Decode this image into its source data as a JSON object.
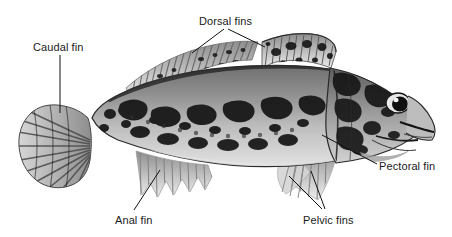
{
  "figure": {
    "type": "anatomical-diagram",
    "background_color": "#ffffff",
    "illustration_style": "grayscale-stipple-drawing",
    "label_text_color": "#1a1a1a",
    "leader_line_color": "#111111"
  },
  "labels": {
    "caudal_fin": "Caudal fin",
    "dorsal_fins": "Dorsal fins",
    "pectoral_fin": "Pectoral fin",
    "anal_fin": "Anal fin",
    "pelvic_fins": "Pelvic fins"
  },
  "callouts": [
    {
      "name": "caudal-fin",
      "label": "Caudal fin",
      "text_x": 33,
      "text_y": 41,
      "branches": 1
    },
    {
      "name": "dorsal-fins",
      "label": "Dorsal fins",
      "text_x": 199,
      "text_y": 15,
      "branches": 2
    },
    {
      "name": "pectoral-fin",
      "label": "Pectoral fin",
      "text_x": 379,
      "text_y": 160,
      "branches": 1
    },
    {
      "name": "anal-fin",
      "label": "Anal fin",
      "text_x": 115,
      "text_y": 214,
      "branches": 1
    },
    {
      "name": "pelvic-fins",
      "label": "Pelvic fins",
      "text_x": 303,
      "text_y": 214,
      "branches": 2
    }
  ],
  "colors": {
    "body_light": "#b9b9b9",
    "body_mid": "#8c8c8c",
    "body_dark": "#3a3a3a",
    "blotch": "#1c1c1c",
    "belly": "#d8d8d8",
    "fin_light": "#cccccc",
    "fin_ray": "#7d7d7d",
    "outline": "#2b2b2b"
  }
}
